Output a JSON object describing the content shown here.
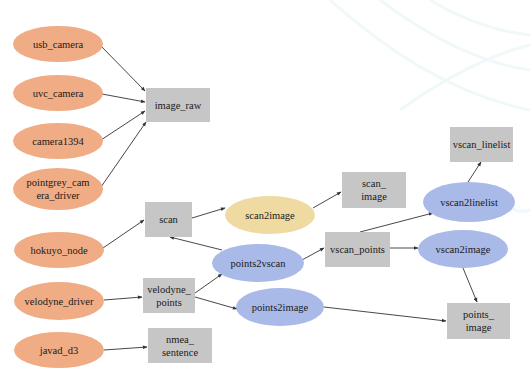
{
  "diagram": {
    "type": "ros-node-topic-graph",
    "colors": {
      "driver_node": "#F0AC84",
      "topic": "#C6C6C6",
      "transform_node_blue": "#A9B9E8",
      "transform_node_yellow": "#EFDBA2",
      "edge": "#333333",
      "text": "#1a1a1a",
      "background": "#ffffff"
    },
    "nodes": [
      {
        "id": "usb_camera",
        "kind": "driver_node",
        "shape": "ellipse",
        "lines": [
          "usb_camera"
        ],
        "cx": 58,
        "cy": 44,
        "rx": 45,
        "ry": 18
      },
      {
        "id": "uvc_camera",
        "kind": "driver_node",
        "shape": "ellipse",
        "lines": [
          "uvc_camera"
        ],
        "cx": 58,
        "cy": 93,
        "rx": 45,
        "ry": 18
      },
      {
        "id": "camera1394",
        "kind": "driver_node",
        "shape": "ellipse",
        "lines": [
          "camera1394"
        ],
        "cx": 58,
        "cy": 141,
        "rx": 45,
        "ry": 18
      },
      {
        "id": "pointgrey_camera_driver",
        "kind": "driver_node",
        "shape": "ellipse",
        "lines": [
          "pointgrey_cam",
          "era_driver"
        ],
        "cx": 58,
        "cy": 189,
        "rx": 45,
        "ry": 21
      },
      {
        "id": "hokuyo_node",
        "kind": "driver_node",
        "shape": "ellipse",
        "lines": [
          "hokuyo_node"
        ],
        "cx": 59,
        "cy": 250,
        "rx": 45,
        "ry": 18
      },
      {
        "id": "velodyne_driver",
        "kind": "driver_node",
        "shape": "ellipse",
        "lines": [
          "velodyne_driver"
        ],
        "cx": 59,
        "cy": 301,
        "rx": 45,
        "ry": 19
      },
      {
        "id": "javad_d3",
        "kind": "driver_node",
        "shape": "ellipse",
        "lines": [
          "javad_d3"
        ],
        "cx": 59,
        "cy": 350,
        "rx": 45,
        "ry": 18
      },
      {
        "id": "image_raw",
        "kind": "topic",
        "shape": "rect",
        "lines": [
          "image_raw"
        ],
        "x": 146,
        "y": 88,
        "w": 64,
        "h": 34
      },
      {
        "id": "scan",
        "kind": "topic",
        "shape": "rect",
        "lines": [
          "scan"
        ],
        "x": 145,
        "y": 202,
        "w": 47,
        "h": 35
      },
      {
        "id": "velodyne_points",
        "kind": "topic",
        "shape": "rect",
        "lines": [
          "velodyne_",
          "points"
        ],
        "x": 143,
        "y": 278,
        "w": 52,
        "h": 35
      },
      {
        "id": "nmea_sentence",
        "kind": "topic",
        "shape": "rect",
        "lines": [
          "nmea_",
          "sentence"
        ],
        "x": 148,
        "y": 328,
        "w": 64,
        "h": 35
      },
      {
        "id": "scan_image",
        "kind": "topic",
        "shape": "rect",
        "lines": [
          "scan_",
          "image"
        ],
        "x": 342,
        "y": 172,
        "w": 64,
        "h": 36
      },
      {
        "id": "vscan_points",
        "kind": "topic",
        "shape": "rect",
        "lines": [
          "vscan_points"
        ],
        "x": 325,
        "y": 232,
        "w": 65,
        "h": 35
      },
      {
        "id": "vscan_linelist",
        "kind": "topic",
        "shape": "rect",
        "lines": [
          "vscan_linelist"
        ],
        "x": 450,
        "y": 127,
        "w": 63,
        "h": 35
      },
      {
        "id": "points_image",
        "kind": "topic",
        "shape": "rect",
        "lines": [
          "points_",
          "image"
        ],
        "x": 447,
        "y": 303,
        "w": 63,
        "h": 36
      },
      {
        "id": "scan2image",
        "kind": "transform_node_yellow",
        "shape": "ellipse",
        "lines": [
          "scan2image"
        ],
        "cx": 270,
        "cy": 215,
        "rx": 45,
        "ry": 19
      },
      {
        "id": "points2vscan",
        "kind": "transform_node_blue",
        "shape": "ellipse",
        "lines": [
          "points2vscan"
        ],
        "cx": 258,
        "cy": 263,
        "rx": 46,
        "ry": 19
      },
      {
        "id": "points2image",
        "kind": "transform_node_blue",
        "shape": "ellipse",
        "lines": [
          "points2image"
        ],
        "cx": 280,
        "cy": 307,
        "rx": 44,
        "ry": 19
      },
      {
        "id": "vscan2linelist",
        "kind": "transform_node_blue",
        "shape": "ellipse",
        "lines": [
          "vscan2linelist"
        ],
        "cx": 469,
        "cy": 202,
        "rx": 46,
        "ry": 20
      },
      {
        "id": "vscan2image",
        "kind": "transform_node_blue",
        "shape": "ellipse",
        "lines": [
          "vscan2image"
        ],
        "cx": 463,
        "cy": 249,
        "rx": 45,
        "ry": 19
      }
    ],
    "edges": [
      {
        "from": "usb_camera",
        "to": "image_raw",
        "x1": 101,
        "y1": 46,
        "x2": 145,
        "y2": 91
      },
      {
        "from": "uvc_camera",
        "to": "image_raw",
        "x1": 102,
        "y1": 94,
        "x2": 145,
        "y2": 102
      },
      {
        "from": "camera1394",
        "to": "image_raw",
        "x1": 101,
        "y1": 140,
        "x2": 145,
        "y2": 111
      },
      {
        "from": "pointgrey_camera_driver",
        "to": "image_raw",
        "x1": 101,
        "y1": 187,
        "x2": 146,
        "y2": 122
      },
      {
        "from": "hokuyo_node",
        "to": "scan",
        "x1": 103,
        "y1": 248,
        "x2": 144,
        "y2": 220
      },
      {
        "from": "velodyne_driver",
        "to": "velodyne_points",
        "x1": 104,
        "y1": 300,
        "x2": 142,
        "y2": 297
      },
      {
        "from": "javad_d3",
        "to": "nmea_sentence",
        "x1": 104,
        "y1": 350,
        "x2": 147,
        "y2": 347
      },
      {
        "from": "velodyne_points",
        "to": "points2vscan",
        "x1": 195,
        "y1": 293,
        "x2": 222,
        "y2": 274
      },
      {
        "from": "velodyne_points",
        "to": "points2image",
        "x1": 195,
        "y1": 297,
        "x2": 237,
        "y2": 309
      },
      {
        "from": "points2vscan",
        "to": "scan",
        "x1": 222,
        "y1": 250,
        "x2": 170,
        "y2": 237
      },
      {
        "from": "scan",
        "to": "scan2image",
        "x1": 192,
        "y1": 218,
        "x2": 225,
        "y2": 208
      },
      {
        "from": "scan2image",
        "to": "scan_image",
        "x1": 313,
        "y1": 208,
        "x2": 341,
        "y2": 192
      },
      {
        "from": "points2vscan",
        "to": "vscan_points",
        "x1": 302,
        "y1": 260,
        "x2": 324,
        "y2": 248
      },
      {
        "from": "vscan_points",
        "to": "vscan2linelist",
        "x1": 360,
        "y1": 232,
        "x2": 433,
        "y2": 213
      },
      {
        "from": "vscan_points",
        "to": "vscan2image",
        "x1": 390,
        "y1": 248,
        "x2": 418,
        "y2": 248
      },
      {
        "from": "vscan2linelist",
        "to": "vscan_linelist",
        "x1": 468,
        "y1": 182,
        "x2": 481,
        "y2": 162
      },
      {
        "from": "vscan2image",
        "to": "points_image",
        "x1": 463,
        "y1": 268,
        "x2": 477,
        "y2": 302
      },
      {
        "from": "points2image",
        "to": "points_image",
        "x1": 324,
        "y1": 307,
        "x2": 446,
        "y2": 321
      }
    ]
  }
}
